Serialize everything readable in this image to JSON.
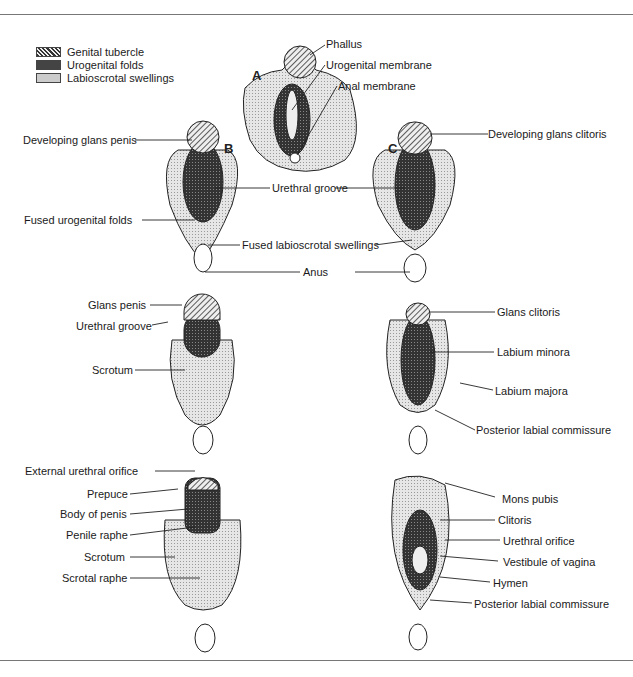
{
  "legend": [
    {
      "label": "Genital tubercle",
      "pattern": "diagonal-hatch"
    },
    {
      "label": "Urogenital folds",
      "pattern": "dark-crosshatch"
    },
    {
      "label": "Labioscrotal swellings",
      "pattern": "light-stipple"
    }
  ],
  "panels": {
    "A": "A",
    "B": "B",
    "C": "C"
  },
  "labels": {
    "phallus": "Phallus",
    "urogenital_membrane": "Urogenital membrane",
    "anal_membrane": "Anal membrane",
    "developing_glans_penis": "Developing glans penis",
    "developing_glans_clitoris": "Developing glans clitoris",
    "urethral_groove_mid": "Urethral groove",
    "fused_urogenital_folds": "Fused urogenital folds",
    "fused_labioscrotal_swellings": "Fused labioscrotal swellings",
    "anus": "Anus",
    "glans_penis": "Glans penis",
    "urethral_groove_male": "Urethral groove",
    "scrotum_1": "Scrotum",
    "glans_clitoris": "Glans clitoris",
    "labium_minora": "Labium minora",
    "labium_majora": "Labium majora",
    "posterior_labial_commissure_1": "Posterior labial commissure",
    "external_urethral_orifice": "External urethral orifice",
    "prepuce": "Prepuce",
    "body_of_penis": "Body of penis",
    "penile_raphe": "Penile raphe",
    "scrotum_2": "Scrotum",
    "scrotal_raphe": "Scrotal raphe",
    "mons_pubis": "Mons pubis",
    "clitoris": "Clitoris",
    "urethral_orifice": "Urethral orifice",
    "vestibule_of_vagina": "Vestibule of vagina",
    "hymen": "Hymen",
    "posterior_labial_commissure_2": "Posterior labial commissure"
  }
}
